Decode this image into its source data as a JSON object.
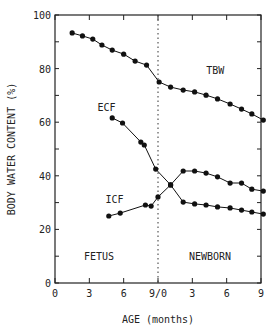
{
  "chart_data": {
    "type": "line",
    "title": "",
    "xlabel": "AGE (months)",
    "ylabel": "BODY WATER CONTENT (%)",
    "ylim": [
      0,
      100
    ],
    "xlim": [
      0,
      18
    ],
    "x_tick_labels": [
      "0",
      "3",
      "6",
      "9/0",
      "3",
      "6",
      "9"
    ],
    "y_tick_labels": [
      "0",
      "20",
      "40",
      "60",
      "80",
      "100"
    ],
    "grid": false,
    "region_labels": [
      "FETUS",
      "NEWBORN"
    ],
    "divider_x": 9,
    "series": [
      {
        "name": "TBW",
        "x": [
          1.5,
          2.4,
          3.3,
          4.1,
          5.0,
          6.0,
          7.0,
          8.0,
          9.1,
          10.1,
          11.2,
          12.2,
          13.2,
          14.2,
          15.3,
          16.3,
          17.2,
          18.2
        ],
        "y": [
          93.3,
          92.2,
          91.0,
          88.8,
          86.9,
          85.4,
          82.8,
          81.3,
          75.0,
          73.1,
          72.0,
          71.3,
          70.1,
          68.7,
          66.8,
          64.9,
          63.1,
          60.8
        ]
      },
      {
        "name": "ECF",
        "x": [
          5.0,
          5.9,
          7.5,
          7.8,
          8.8,
          10.1,
          11.2,
          12.2,
          13.2,
          14.2,
          15.3,
          16.3,
          17.2,
          18.2
        ],
        "y": [
          61.6,
          59.7,
          52.6,
          51.5,
          42.5,
          36.6,
          41.8,
          41.8,
          41.0,
          39.6,
          37.3,
          37.3,
          35.0,
          34.3
        ],
        "note": "approx"
      },
      {
        "name": "ICF",
        "x": [
          4.7,
          5.7,
          7.9,
          8.4,
          9.0,
          10.1,
          11.2,
          12.2,
          13.2,
          14.2,
          15.3,
          16.3,
          17.2,
          18.2
        ],
        "y": [
          25.0,
          26.1,
          29.1,
          28.7,
          32.1,
          36.6,
          30.2,
          29.5,
          29.1,
          28.4,
          28.0,
          27.2,
          26.5,
          25.7
        ]
      }
    ],
    "series_labels": [
      {
        "text": "TBW",
        "x": 14.0,
        "y": 78
      },
      {
        "text": "ECF",
        "x": 4.5,
        "y": 64
      },
      {
        "text": "ICF",
        "x": 5.2,
        "y": 30
      }
    ]
  }
}
